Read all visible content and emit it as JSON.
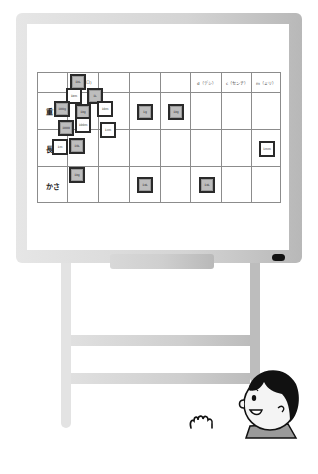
{
  "scene": {
    "description": "Whiteboard on easel with unit classification table; boy character at bottom right"
  },
  "colors": {
    "frame": "#d4d4d4",
    "grid_line": "#8c8c8c",
    "card_border": "#2a2a2a",
    "card_fill": "#bdbdbd",
    "marker": "#111111"
  },
  "table": {
    "headers": [
      "",
      "",
      "",
      "",
      "",
      "d（デシ）",
      "c（センチ）",
      "m（ミリ）"
    ],
    "rows": [
      {
        "label": "重さ"
      },
      {
        "label": "長さ"
      },
      {
        "label": "かさ"
      }
    ],
    "header_fragment": "ロ)"
  },
  "cards": [
    {
      "id": "c1",
      "text": "1kL",
      "x": 70,
      "y": 74,
      "style": "dark"
    },
    {
      "id": "c2",
      "text": "1L",
      "x": 87,
      "y": 88,
      "style": "dark"
    },
    {
      "id": "c3",
      "text": "1km",
      "x": 66,
      "y": 88,
      "style": "light"
    },
    {
      "id": "c4",
      "text": "100g",
      "x": 54,
      "y": 101,
      "style": "dark"
    },
    {
      "id": "c5",
      "text": "1kg",
      "x": 75,
      "y": 104,
      "style": "dark"
    },
    {
      "id": "c6",
      "text": "10m",
      "x": 97,
      "y": 101,
      "style": "light"
    },
    {
      "id": "c7",
      "text": "100m",
      "x": 75,
      "y": 117,
      "style": "light"
    },
    {
      "id": "c8",
      "text": "1000",
      "x": 58,
      "y": 120,
      "style": "dark"
    },
    {
      "id": "c9",
      "text": "1cm",
      "x": 100,
      "y": 122,
      "style": "light"
    },
    {
      "id": "c10",
      "text": "1m",
      "x": 52,
      "y": 139,
      "style": "light"
    },
    {
      "id": "c11",
      "text": "10L",
      "x": 69,
      "y": 138,
      "style": "dark"
    },
    {
      "id": "c12",
      "text": "1kg",
      "x": 69,
      "y": 167,
      "style": "dark"
    },
    {
      "id": "c13",
      "text": "1g",
      "x": 137,
      "y": 104,
      "style": "dark"
    },
    {
      "id": "c14",
      "text": "1kg",
      "x": 168,
      "y": 104,
      "style": "dark"
    },
    {
      "id": "c15",
      "text": "1mm",
      "x": 259,
      "y": 141,
      "style": "light"
    },
    {
      "id": "c16",
      "text": "1dL",
      "x": 137,
      "y": 177,
      "style": "dark"
    },
    {
      "id": "c17",
      "text": "1dL",
      "x": 199,
      "y": 177,
      "style": "dark"
    }
  ]
}
